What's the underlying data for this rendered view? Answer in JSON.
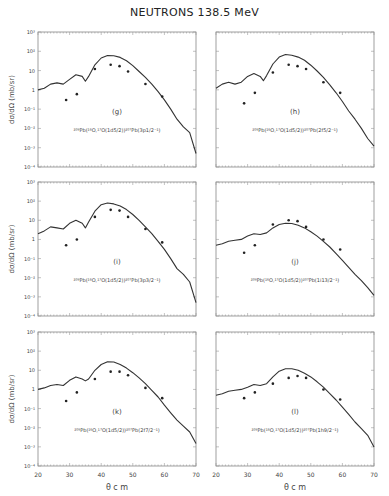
{
  "title": "NEUTRONS  138.5 MeV",
  "axes": {
    "xlabel": "θ c m",
    "ylabel": "dσ/dΩ (mb/sr)",
    "xticks": [
      20,
      30,
      40,
      50,
      60,
      70
    ],
    "xtick_labels": [
      "20",
      "30",
      "40",
      "50",
      "60",
      "70"
    ],
    "yticks": [
      1000,
      100,
      10,
      1,
      0.1,
      0.01,
      0.001,
      0.0001
    ],
    "ytick_labels": [
      "10³",
      "10²",
      "10",
      "1",
      "10⁻¹",
      "10⁻²",
      "10⁻³",
      "10⁻⁴"
    ]
  },
  "chart_data": [
    {
      "type": "line",
      "panel": "(g)",
      "annotation": "²⁰⁸Pb(¹⁶O,¹⁷O(1d5/2))²⁰⁷Pb(3p1/2⁻¹)",
      "xlim": [
        20,
        70
      ],
      "ylim": [
        0.0001,
        1000
      ],
      "yscale": "log",
      "series": [
        {
          "name": "DWBA calculation",
          "style": "line",
          "x": [
            20,
            22,
            24,
            26,
            28,
            30,
            32,
            34,
            35,
            36,
            38,
            40,
            42,
            44,
            46,
            48,
            50,
            52,
            54,
            56,
            58,
            60,
            62,
            64,
            66,
            68,
            70
          ],
          "y": [
            1.0,
            1.2,
            2.0,
            2.3,
            2.0,
            3.5,
            6.0,
            5.0,
            2.8,
            5.0,
            20,
            45,
            60,
            58,
            48,
            32,
            18,
            9,
            4.5,
            2.0,
            0.8,
            0.3,
            0.1,
            0.03,
            0.012,
            0.006,
            0.0005
          ]
        },
        {
          "name": "data",
          "style": "points",
          "x": [
            28.9,
            32.3,
            38,
            43,
            45.8,
            48.5,
            54,
            59.3
          ],
          "y": [
            0.3,
            0.6,
            12,
            20,
            17,
            9,
            2,
            0.45
          ]
        }
      ]
    },
    {
      "type": "line",
      "panel": "(h)",
      "annotation": "²⁰⁸Pb(¹⁶O,¹⁷O(1d5/2))²⁰⁷Pb(2f5/2⁻¹)",
      "xlim": [
        20,
        70
      ],
      "ylim": [
        0.0001,
        1000
      ],
      "yscale": "log",
      "series": [
        {
          "name": "DWBA calculation",
          "style": "line",
          "x": [
            20,
            22,
            24,
            26,
            28,
            30,
            32,
            34,
            35,
            36,
            38,
            40,
            42,
            44,
            46,
            48,
            50,
            52,
            54,
            56,
            58,
            60,
            62,
            64,
            66,
            68,
            70
          ],
          "y": [
            1.2,
            2.0,
            2.5,
            2.0,
            2.5,
            5.0,
            7.0,
            5.0,
            3.0,
            5.5,
            22,
            50,
            68,
            62,
            50,
            34,
            19,
            9.5,
            4.5,
            1.8,
            0.7,
            0.25,
            0.08,
            0.03,
            0.01,
            0.003,
            0.0012
          ]
        },
        {
          "name": "data",
          "style": "points",
          "x": [
            28.9,
            32.3,
            38,
            43,
            45.8,
            48.5,
            54,
            59.3
          ],
          "y": [
            0.2,
            0.7,
            8,
            20,
            17,
            12,
            2.5,
            0.7
          ]
        }
      ]
    },
    {
      "type": "line",
      "panel": "(i)",
      "annotation": "²⁰⁸Pb(¹⁶O,¹⁷O(1d5/2))²⁰⁷Pb(3p3/2⁻¹)",
      "xlim": [
        20,
        70
      ],
      "ylim": [
        0.0001,
        1000
      ],
      "yscale": "log",
      "series": [
        {
          "name": "DWBA calculation",
          "style": "line",
          "x": [
            20,
            22,
            24,
            26,
            28,
            30,
            32,
            34,
            35,
            36,
            38,
            40,
            42,
            44,
            46,
            48,
            50,
            52,
            54,
            56,
            58,
            60,
            62,
            64,
            66,
            68,
            70
          ],
          "y": [
            2.0,
            2.8,
            4.5,
            4.0,
            3.5,
            7.0,
            10,
            7.0,
            4.0,
            8.0,
            30,
            65,
            80,
            72,
            55,
            36,
            20,
            10,
            4.5,
            2.0,
            0.8,
            0.3,
            0.1,
            0.03,
            0.015,
            0.006,
            0.0005
          ]
        },
        {
          "name": "data",
          "style": "points",
          "x": [
            28.9,
            32.3,
            38,
            43,
            45.8,
            48.5,
            54,
            59.3
          ],
          "y": [
            0.5,
            1.0,
            15,
            35,
            32,
            15,
            3.5,
            0.7
          ]
        }
      ]
    },
    {
      "type": "line",
      "panel": "(j)",
      "annotation": "²⁰⁸Pb(¹⁶O,¹⁷O(1d5/2))²⁰⁷Pb(1i13/2⁻¹)",
      "xlim": [
        20,
        70
      ],
      "ylim": [
        0.0001,
        1000
      ],
      "yscale": "log",
      "series": [
        {
          "name": "DWBA calculation",
          "style": "line",
          "x": [
            20,
            22,
            24,
            26,
            28,
            30,
            32,
            34,
            36,
            38,
            40,
            42,
            44,
            46,
            48,
            50,
            52,
            54,
            56,
            58,
            60,
            62,
            64,
            66,
            68,
            70
          ],
          "y": [
            0.5,
            0.6,
            0.8,
            0.9,
            1.0,
            1.5,
            2.0,
            1.8,
            2.2,
            4.0,
            6.0,
            7.0,
            6.8,
            5.5,
            4.0,
            2.5,
            1.5,
            0.8,
            0.4,
            0.18,
            0.08,
            0.035,
            0.015,
            0.007,
            0.003,
            0.0012
          ]
        },
        {
          "name": "data",
          "style": "points",
          "x": [
            28.9,
            32.3,
            38,
            43,
            45.8,
            48.5,
            54,
            59.3
          ],
          "y": [
            0.2,
            0.5,
            6,
            10,
            9,
            4.5,
            1.0,
            0.3
          ]
        }
      ]
    },
    {
      "type": "line",
      "panel": "(k)",
      "annotation": "²⁰⁸Pb(¹⁶O,¹⁷O(1d5/2))²⁰⁷Pb(2f7/2⁻¹)",
      "xlim": [
        20,
        70
      ],
      "ylim": [
        0.0001,
        1000
      ],
      "yscale": "log",
      "series": [
        {
          "name": "DWBA calculation",
          "style": "line",
          "x": [
            20,
            22,
            24,
            26,
            28,
            30,
            32,
            34,
            35,
            36,
            38,
            40,
            42,
            44,
            46,
            48,
            50,
            52,
            54,
            56,
            58,
            60,
            62,
            64,
            66,
            68,
            70
          ],
          "y": [
            1.0,
            1.2,
            1.6,
            1.8,
            1.6,
            3.0,
            4.5,
            3.5,
            2.8,
            3.5,
            10,
            20,
            28,
            27,
            20,
            13,
            7.5,
            4.0,
            2.0,
            0.9,
            0.4,
            0.15,
            0.06,
            0.025,
            0.012,
            0.006,
            0.0015
          ]
        },
        {
          "name": "data",
          "style": "points",
          "x": [
            28.9,
            32.3,
            38,
            43,
            45.8,
            48.5,
            54,
            59.3
          ],
          "y": [
            0.25,
            0.7,
            3.5,
            8.5,
            8.5,
            5.5,
            1.2,
            0.35
          ]
        }
      ]
    },
    {
      "type": "line",
      "panel": "(l)",
      "annotation": "²⁰⁸Pb(¹⁶O,¹⁷O(1d5/2))²⁰⁷Pb(1h9/2⁻¹)",
      "xlim": [
        20,
        70
      ],
      "ylim": [
        0.0001,
        1000
      ],
      "yscale": "log",
      "series": [
        {
          "name": "DWBA calculation",
          "style": "line",
          "x": [
            20,
            22,
            24,
            26,
            28,
            30,
            32,
            34,
            36,
            38,
            40,
            42,
            44,
            46,
            48,
            50,
            52,
            54,
            56,
            58,
            60,
            62,
            64,
            66,
            68,
            70
          ],
          "y": [
            0.5,
            0.6,
            0.8,
            0.9,
            1.0,
            1.3,
            1.8,
            1.6,
            2.0,
            4.5,
            9.0,
            12,
            12,
            10,
            7.0,
            4.5,
            2.5,
            1.3,
            0.6,
            0.28,
            0.12,
            0.05,
            0.02,
            0.009,
            0.004,
            0.001
          ]
        },
        {
          "name": "data",
          "style": "points",
          "x": [
            28.9,
            32.3,
            38,
            43,
            45.8,
            48.5,
            54,
            59.3
          ],
          "y": [
            0.35,
            0.7,
            2.0,
            4.0,
            5.0,
            4.0,
            1.0,
            0.3
          ]
        }
      ]
    }
  ]
}
